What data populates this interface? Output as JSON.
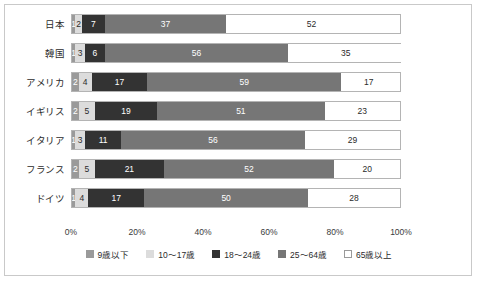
{
  "chart_data": {
    "type": "bar",
    "subtype": "stacked-horizontal-100percent",
    "title": "",
    "subtitle": "",
    "xlabel": "",
    "ylabel": "",
    "xlim": [
      0,
      100
    ],
    "grid": false,
    "legend_position": "bottom-center",
    "categories": [
      "日本",
      "韓国",
      "アメリカ",
      "イギリス",
      "イタリア",
      "フランス",
      "ドイツ"
    ],
    "xticks": [
      "0%",
      "20%",
      "40%",
      "60%",
      "80%",
      "100%"
    ],
    "xtick_values": [
      0,
      20,
      40,
      60,
      80,
      100
    ],
    "series": [
      {
        "name": "9歳以下",
        "color": "#9a9a9a",
        "values": [
          1,
          1,
          2,
          2,
          1,
          2,
          1
        ]
      },
      {
        "name": "10～17歳",
        "color": "#dcdcdc",
        "values": [
          2,
          3,
          4,
          5,
          3,
          5,
          4
        ]
      },
      {
        "name": "18～24歳",
        "color": "#333333",
        "values": [
          7,
          6,
          17,
          19,
          11,
          21,
          17
        ]
      },
      {
        "name": "25～64歳",
        "color": "#767676",
        "values": [
          37,
          56,
          59,
          51,
          56,
          52,
          50
        ]
      },
      {
        "name": "65歳以上",
        "color": "#ffffff",
        "values": [
          52,
          35,
          17,
          23,
          29,
          20,
          28
        ]
      }
    ],
    "rows": [
      {
        "label": "日本",
        "segments": [
          {
            "series": "9歳以下",
            "value": 1,
            "text": "1",
            "color": "#9a9a9a",
            "text_tone": "dark-bg"
          },
          {
            "series": "10～17歳",
            "value": 2,
            "text": "2",
            "color": "#dcdcdc",
            "text_tone": "light-bg"
          },
          {
            "series": "18～24歳",
            "value": 7,
            "text": "7",
            "color": "#333333",
            "text_tone": "dark-bg"
          },
          {
            "series": "25～64歳",
            "value": 37,
            "text": "37",
            "color": "#767676",
            "text_tone": "dark-bg"
          },
          {
            "series": "65歳以上",
            "value": 52,
            "text": "52",
            "color": "#ffffff",
            "text_tone": "light-bg"
          }
        ]
      },
      {
        "label": "韓国",
        "segments": [
          {
            "series": "9歳以下",
            "value": 1,
            "text": "1",
            "color": "#9a9a9a",
            "text_tone": "dark-bg"
          },
          {
            "series": "10～17歳",
            "value": 3,
            "text": "3",
            "color": "#dcdcdc",
            "text_tone": "light-bg"
          },
          {
            "series": "18～24歳",
            "value": 6,
            "text": "6",
            "color": "#333333",
            "text_tone": "dark-bg"
          },
          {
            "series": "25～64歳",
            "value": 56,
            "text": "56",
            "color": "#767676",
            "text_tone": "dark-bg"
          },
          {
            "series": "65歳以上",
            "value": 35,
            "text": "35",
            "color": "#ffffff",
            "text_tone": "light-bg"
          }
        ]
      },
      {
        "label": "アメリカ",
        "segments": [
          {
            "series": "9歳以下",
            "value": 2,
            "text": "2",
            "color": "#9a9a9a",
            "text_tone": "dark-bg"
          },
          {
            "series": "10～17歳",
            "value": 4,
            "text": "4",
            "color": "#dcdcdc",
            "text_tone": "light-bg"
          },
          {
            "series": "18～24歳",
            "value": 17,
            "text": "17",
            "color": "#333333",
            "text_tone": "dark-bg"
          },
          {
            "series": "25～64歳",
            "value": 59,
            "text": "59",
            "color": "#767676",
            "text_tone": "dark-bg"
          },
          {
            "series": "65歳以上",
            "value": 17,
            "text": "17",
            "color": "#ffffff",
            "text_tone": "light-bg"
          }
        ]
      },
      {
        "label": "イギリス",
        "segments": [
          {
            "series": "9歳以下",
            "value": 2,
            "text": "2",
            "color": "#9a9a9a",
            "text_tone": "dark-bg"
          },
          {
            "series": "10～17歳",
            "value": 5,
            "text": "5",
            "color": "#dcdcdc",
            "text_tone": "light-bg"
          },
          {
            "series": "18～24歳",
            "value": 19,
            "text": "19",
            "color": "#333333",
            "text_tone": "dark-bg"
          },
          {
            "series": "25～64歳",
            "value": 51,
            "text": "51",
            "color": "#767676",
            "text_tone": "dark-bg"
          },
          {
            "series": "65歳以上",
            "value": 23,
            "text": "23",
            "color": "#ffffff",
            "text_tone": "light-bg"
          }
        ]
      },
      {
        "label": "イタリア",
        "segments": [
          {
            "series": "9歳以下",
            "value": 1,
            "text": "1",
            "color": "#9a9a9a",
            "text_tone": "dark-bg"
          },
          {
            "series": "10～17歳",
            "value": 3,
            "text": "3",
            "color": "#dcdcdc",
            "text_tone": "light-bg"
          },
          {
            "series": "18～24歳",
            "value": 11,
            "text": "11",
            "color": "#333333",
            "text_tone": "dark-bg"
          },
          {
            "series": "25～64歳",
            "value": 56,
            "text": "56",
            "color": "#767676",
            "text_tone": "dark-bg"
          },
          {
            "series": "65歳以上",
            "value": 29,
            "text": "29",
            "color": "#ffffff",
            "text_tone": "light-bg"
          }
        ]
      },
      {
        "label": "フランス",
        "segments": [
          {
            "series": "9歳以下",
            "value": 2,
            "text": "2",
            "color": "#9a9a9a",
            "text_tone": "dark-bg"
          },
          {
            "series": "10～17歳",
            "value": 5,
            "text": "5",
            "color": "#dcdcdc",
            "text_tone": "light-bg"
          },
          {
            "series": "18～24歳",
            "value": 21,
            "text": "21",
            "color": "#333333",
            "text_tone": "dark-bg"
          },
          {
            "series": "25～64歳",
            "value": 52,
            "text": "52",
            "color": "#767676",
            "text_tone": "dark-bg"
          },
          {
            "series": "65歳以上",
            "value": 20,
            "text": "20",
            "color": "#ffffff",
            "text_tone": "light-bg"
          }
        ]
      },
      {
        "label": "ドイツ",
        "segments": [
          {
            "series": "9歳以下",
            "value": 1,
            "text": "1",
            "color": "#9a9a9a",
            "text_tone": "dark-bg"
          },
          {
            "series": "10～17歳",
            "value": 4,
            "text": "4",
            "color": "#dcdcdc",
            "text_tone": "light-bg"
          },
          {
            "series": "18～24歳",
            "value": 17,
            "text": "17",
            "color": "#333333",
            "text_tone": "dark-bg"
          },
          {
            "series": "25～64歳",
            "value": 50,
            "text": "50",
            "color": "#767676",
            "text_tone": "dark-bg"
          },
          {
            "series": "65歳以上",
            "value": 28,
            "text": "28",
            "color": "#ffffff",
            "text_tone": "light-bg"
          }
        ]
      }
    ],
    "legend": [
      {
        "label": "9歳以下",
        "color": "#9a9a9a",
        "outline": false
      },
      {
        "label": "10～17歳",
        "color": "#dcdcdc",
        "outline": false
      },
      {
        "label": "18～24歳",
        "color": "#333333",
        "outline": false
      },
      {
        "label": "25～64歳",
        "color": "#767676",
        "outline": false
      },
      {
        "label": "65歳以上",
        "color": "#ffffff",
        "outline": true
      }
    ]
  }
}
